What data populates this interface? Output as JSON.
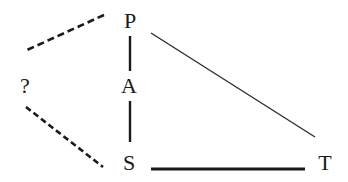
{
  "diagram": {
    "nodes": [
      {
        "id": "P",
        "label": "P"
      },
      {
        "id": "A",
        "label": "A"
      },
      {
        "id": "S",
        "label": "S"
      },
      {
        "id": "T",
        "label": "T"
      },
      {
        "id": "Q",
        "label": "?"
      }
    ],
    "edges": [
      {
        "from": "P",
        "to": "A",
        "style": "solid"
      },
      {
        "from": "A",
        "to": "S",
        "style": "solid"
      },
      {
        "from": "P",
        "to": "T",
        "style": "solid-thin"
      },
      {
        "from": "S",
        "to": "T",
        "style": "solid-thick"
      },
      {
        "from": "P",
        "to": "?",
        "style": "dashed"
      },
      {
        "from": "?",
        "to": "S",
        "style": "dashed"
      }
    ],
    "colors": {
      "line": "#1a1a1a",
      "background": "#ffffff"
    }
  }
}
